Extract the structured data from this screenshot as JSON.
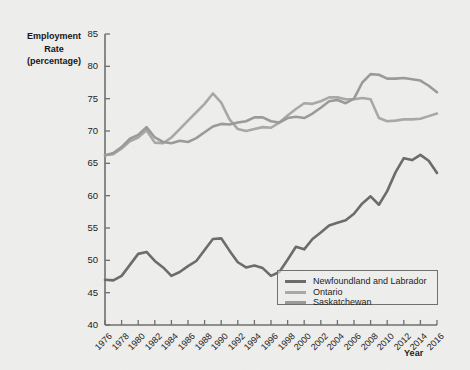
{
  "chart_data": {
    "type": "line",
    "title": "",
    "ylabel": "Employment Rate (percentage)",
    "ylabel_lines": [
      "Employment",
      "Rate",
      "(percentage)"
    ],
    "xlabel": "Year",
    "ylim": [
      40,
      85
    ],
    "y_ticks": [
      40,
      45,
      50,
      55,
      60,
      65,
      70,
      75,
      80,
      85
    ],
    "xlim": [
      1976,
      2016
    ],
    "x_ticks": [
      "1976",
      "1978",
      "1980",
      "1982",
      "1984",
      "1986",
      "1988",
      "1990",
      "1992",
      "1994",
      "1996",
      "1998",
      "2000",
      "2002",
      "2004",
      "2006",
      "2008",
      "2010",
      "2012",
      "2014",
      "2016"
    ],
    "grid": false,
    "legend_position": "inside-bottom-right",
    "x": [
      1976,
      1977,
      1978,
      1979,
      1980,
      1981,
      1982,
      1983,
      1984,
      1985,
      1986,
      1987,
      1988,
      1989,
      1990,
      1991,
      1992,
      1993,
      1994,
      1995,
      1996,
      1997,
      1998,
      1999,
      2000,
      2001,
      2002,
      2003,
      2004,
      2005,
      2006,
      2007,
      2008,
      2009,
      2010,
      2011,
      2012,
      2013,
      2014,
      2015,
      2016
    ],
    "series": [
      {
        "name": "Newfoundland and Labrador",
        "color": "#6b6b6b",
        "values": [
          47.0,
          46.9,
          47.6,
          49.3,
          51.0,
          51.3,
          49.9,
          48.9,
          47.6,
          48.2,
          49.1,
          49.9,
          51.6,
          53.3,
          53.4,
          51.5,
          49.7,
          48.9,
          49.2,
          48.8,
          47.6,
          48.2,
          50.1,
          52.1,
          51.7,
          53.3,
          54.3,
          55.4,
          55.8,
          56.2,
          57.2,
          58.8,
          59.9,
          58.6,
          60.7,
          63.6,
          65.8,
          65.5,
          66.3,
          65.4,
          63.5
        ]
      },
      {
        "name": "Ontario",
        "color": "#a8a8a8",
        "values": [
          66.3,
          66.4,
          67.3,
          68.4,
          69.0,
          70.1,
          68.2,
          68.1,
          69.0,
          70.3,
          71.6,
          72.9,
          74.2,
          75.8,
          74.4,
          71.8,
          70.3,
          70.0,
          70.3,
          70.6,
          70.5,
          71.3,
          72.4,
          73.4,
          74.3,
          74.2,
          74.6,
          75.2,
          75.2,
          74.9,
          74.9,
          75.1,
          74.9,
          72.0,
          71.5,
          71.6,
          71.8,
          71.8,
          71.9,
          72.3,
          72.7
        ]
      },
      {
        "name": "Saskatchewan",
        "color": "#9a9a9a",
        "values": [
          66.2,
          66.6,
          67.5,
          68.8,
          69.4,
          70.6,
          69.0,
          68.3,
          68.1,
          68.5,
          68.3,
          68.9,
          69.8,
          70.7,
          71.1,
          71.0,
          71.3,
          71.5,
          72.1,
          72.1,
          71.5,
          71.3,
          72.0,
          72.2,
          72.0,
          72.7,
          73.6,
          74.6,
          74.8,
          74.3,
          75.0,
          77.5,
          78.8,
          78.7,
          78.1,
          78.1,
          78.2,
          78.0,
          77.8,
          77.0,
          76.0
        ]
      }
    ]
  },
  "legend": {
    "items": [
      {
        "label": "Newfoundland and Labrador"
      },
      {
        "label": "Ontario"
      },
      {
        "label": "Saskatchewan"
      }
    ]
  },
  "axis_color": "#6e6e6e"
}
